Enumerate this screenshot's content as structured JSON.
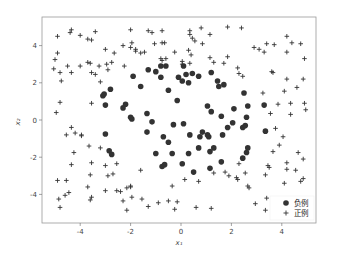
{
  "chart_data": {
    "type": "scatter",
    "title": "",
    "xlabel": "x₁",
    "ylabel": "x₂",
    "xlim": [
      -5.4,
      5.4
    ],
    "ylim": [
      -5.5,
      5.5
    ],
    "xticks": [
      -4,
      -2,
      0,
      2,
      4
    ],
    "yticks": [
      -4,
      -2,
      0,
      2,
      4
    ],
    "grid": false,
    "legend_position": "lower right",
    "series": [
      {
        "name": "负例",
        "marker": "circle",
        "color": "#333333",
        "points": [
          [
            -1.3,
            2.7
          ],
          [
            -1.0,
            2.6
          ],
          [
            -0.8,
            2.9
          ],
          [
            -0.6,
            2.9
          ],
          [
            -0.8,
            2.3
          ],
          [
            -1.9,
            2.35
          ],
          [
            -2.8,
            1.65
          ],
          [
            -1.6,
            1.8
          ],
          [
            -0.5,
            1.6
          ],
          [
            -3.1,
            1.3
          ],
          [
            -3.05,
            1.4
          ],
          [
            -3.0,
            0.8
          ],
          [
            -2.2,
            0.85
          ],
          [
            -2.3,
            0.65
          ],
          [
            -0.15,
            1.05
          ],
          [
            -0.1,
            2.3
          ],
          [
            0.05,
            2.1
          ],
          [
            0.1,
            2.9
          ],
          [
            0.2,
            2.45
          ],
          [
            0.3,
            2.0
          ],
          [
            0.45,
            2.5
          ],
          [
            0.7,
            2.35
          ],
          [
            1.2,
            2.55
          ],
          [
            1.45,
            2.1
          ],
          [
            1.5,
            1.8
          ],
          [
            1.7,
            1.9
          ],
          [
            2.5,
            1.45
          ],
          [
            -2.0,
            0.15
          ],
          [
            -1.95,
            0.05
          ],
          [
            -1.35,
            0.35
          ],
          [
            -1.15,
            -0.1
          ],
          [
            -0.3,
            -0.25
          ],
          [
            0.1,
            -0.2
          ],
          [
            1.05,
            0.75
          ],
          [
            1.2,
            0.45
          ],
          [
            1.6,
            0.2
          ],
          [
            2.1,
            0.6
          ],
          [
            2.65,
            0.75
          ],
          [
            2.6,
            0.15
          ],
          [
            3.3,
            0.8
          ],
          [
            -3.0,
            -0.75
          ],
          [
            -1.35,
            -0.65
          ],
          [
            -0.7,
            -0.9
          ],
          [
            -0.5,
            -1.2
          ],
          [
            0.35,
            -0.8
          ],
          [
            0.75,
            -0.9
          ],
          [
            0.85,
            -0.65
          ],
          [
            1.05,
            -0.8
          ],
          [
            1.1,
            -0.9
          ],
          [
            1.65,
            -0.8
          ],
          [
            1.85,
            -0.4
          ],
          [
            2.05,
            -0.15
          ],
          [
            2.45,
            -0.4
          ],
          [
            2.55,
            -0.3
          ],
          [
            3.35,
            -0.6
          ],
          [
            -2.85,
            -1.65
          ],
          [
            -2.75,
            -1.85
          ],
          [
            -1.0,
            -1.8
          ],
          [
            -0.35,
            -1.8
          ],
          [
            0.3,
            -1.8
          ],
          [
            0.7,
            -1.5
          ],
          [
            1.15,
            -1.7
          ],
          [
            1.3,
            -1.5
          ],
          [
            2.45,
            -2.05
          ],
          [
            2.6,
            -1.75
          ],
          [
            2.65,
            -1.5
          ],
          [
            1.6,
            -2.25
          ],
          [
            -0.75,
            -2.5
          ],
          [
            -0.65,
            -2.4
          ],
          [
            0.05,
            -2.35
          ],
          [
            0.5,
            -2.8
          ],
          [
            1.15,
            -2.6
          ]
        ]
      },
      {
        "name": "正例",
        "marker": "plus",
        "color": "#333333",
        "points": [
          [
            -4.9,
            4.5
          ],
          [
            -4.4,
            4.7
          ],
          [
            -4.35,
            4.85
          ],
          [
            -4.0,
            4.55
          ],
          [
            -3.7,
            4.35
          ],
          [
            -3.55,
            4.3
          ],
          [
            -3.4,
            4.75
          ],
          [
            -2.0,
            4.85
          ],
          [
            -1.3,
            4.8
          ],
          [
            -1.15,
            4.7
          ],
          [
            -0.75,
            4.8
          ],
          [
            0.35,
            4.8
          ],
          [
            0.35,
            4.6
          ],
          [
            0.45,
            4.4
          ],
          [
            0.55,
            4.25
          ],
          [
            0.8,
            4.95
          ],
          [
            1.15,
            4.6
          ],
          [
            1.85,
            5.0
          ],
          [
            2.4,
            4.95
          ],
          [
            4.2,
            4.5
          ],
          [
            -4.9,
            3.6
          ],
          [
            -5.0,
            3.25
          ],
          [
            -4.5,
            2.9
          ],
          [
            -3.7,
            3.1
          ],
          [
            -3.6,
            3.05
          ],
          [
            -3.0,
            3.8
          ],
          [
            -2.65,
            3.6
          ],
          [
            -2.3,
            4.0
          ],
          [
            -2.0,
            3.9
          ],
          [
            -1.95,
            4.15
          ],
          [
            -1.8,
            3.8
          ],
          [
            -1.8,
            3.7
          ],
          [
            -1.6,
            3.6
          ],
          [
            -1.45,
            3.65
          ],
          [
            -1.05,
            4.1
          ],
          [
            -0.75,
            4.15
          ],
          [
            -0.65,
            4.15
          ],
          [
            -0.25,
            3.65
          ],
          [
            0.3,
            3.75
          ],
          [
            0.4,
            3.5
          ],
          [
            0.85,
            4.1
          ],
          [
            1.15,
            3.35
          ],
          [
            1.3,
            3.1
          ],
          [
            1.85,
            3.4
          ],
          [
            2.9,
            3.9
          ],
          [
            3.1,
            3.8
          ],
          [
            3.3,
            3.65
          ],
          [
            3.4,
            4.1
          ],
          [
            3.7,
            4.05
          ],
          [
            4.2,
            3.65
          ],
          [
            4.4,
            4.15
          ],
          [
            4.75,
            4.1
          ],
          [
            4.9,
            3.3
          ],
          [
            -5.05,
            2.75
          ],
          [
            -4.8,
            2.55
          ],
          [
            -4.75,
            2.1
          ],
          [
            -4.35,
            2.55
          ],
          [
            -4.0,
            2.9
          ],
          [
            -3.55,
            2.55
          ],
          [
            -3.4,
            2.45
          ],
          [
            -3.25,
            2.9
          ],
          [
            -3.2,
            2.05
          ],
          [
            -2.95,
            3.0
          ],
          [
            -2.9,
            2.7
          ],
          [
            -2.75,
            3.1
          ],
          [
            -2.25,
            2.9
          ],
          [
            -0.75,
            3.2
          ],
          [
            -0.8,
            3.3
          ],
          [
            -0.6,
            3.3
          ],
          [
            0.05,
            3.15
          ],
          [
            0.05,
            3.0
          ],
          [
            0.35,
            3.05
          ],
          [
            1.7,
            3.05
          ],
          [
            2.25,
            2.8
          ],
          [
            2.3,
            2.5
          ],
          [
            2.45,
            2.35
          ],
          [
            3.6,
            2.6
          ],
          [
            3.65,
            2.55
          ],
          [
            4.2,
            2.2
          ],
          [
            4.85,
            2.2
          ],
          [
            -4.8,
            0.95
          ],
          [
            -4.95,
            0.4
          ],
          [
            -3.55,
            0.9
          ],
          [
            3.25,
            1.45
          ],
          [
            3.85,
            0.85
          ],
          [
            4.1,
            1.55
          ],
          [
            4.35,
            0.9
          ],
          [
            4.35,
            0.3
          ],
          [
            4.6,
            1.75
          ],
          [
            4.9,
            0.9
          ],
          [
            4.95,
            0.55
          ],
          [
            3.55,
            0.35
          ],
          [
            -4.35,
            -0.4
          ],
          [
            -4.55,
            -0.8
          ],
          [
            -4.2,
            -0.7
          ],
          [
            -3.95,
            -0.8
          ],
          [
            -4.25,
            -1.75
          ],
          [
            -3.65,
            -1.4
          ],
          [
            -3.2,
            -1.5
          ],
          [
            -3.95,
            -0.85
          ],
          [
            3.75,
            -0.45
          ],
          [
            4.05,
            -0.9
          ],
          [
            3.65,
            -1.7
          ],
          [
            3.9,
            -1.35
          ],
          [
            4.65,
            -1.75
          ],
          [
            -4.35,
            -2.4
          ],
          [
            -3.55,
            -2.3
          ],
          [
            -3.6,
            -2.95
          ],
          [
            -3.0,
            -2.45
          ],
          [
            -2.9,
            -3.0
          ],
          [
            -2.7,
            -2.9
          ],
          [
            -2.55,
            -2.35
          ],
          [
            -1.6,
            -2.7
          ],
          [
            -0.35,
            -3.55
          ],
          [
            0.15,
            -3.2
          ],
          [
            0.7,
            -3.3
          ],
          [
            1.3,
            -2.85
          ],
          [
            1.75,
            -2.8
          ],
          [
            1.9,
            -3.0
          ],
          [
            2.2,
            -3.1
          ],
          [
            2.25,
            -3.2
          ],
          [
            2.3,
            -2.35
          ],
          [
            2.55,
            -2.85
          ],
          [
            2.65,
            -3.55
          ],
          [
            2.7,
            -3.65
          ],
          [
            3.35,
            -2.95
          ],
          [
            3.45,
            -2.45
          ],
          [
            3.5,
            -2.55
          ],
          [
            4.2,
            -2.3
          ],
          [
            4.2,
            -2.65
          ],
          [
            4.55,
            -2.7
          ],
          [
            4.85,
            -2.1
          ],
          [
            4.85,
            -3.15
          ],
          [
            4.75,
            -3.3
          ],
          [
            -4.9,
            -3.25
          ],
          [
            -4.55,
            -3.25
          ],
          [
            -4.85,
            -4.25
          ],
          [
            -4.6,
            -4.05
          ],
          [
            -4.45,
            -3.9
          ],
          [
            -4.8,
            -4.7
          ],
          [
            -3.7,
            -3.6
          ],
          [
            -3.6,
            -4.3
          ],
          [
            -3.55,
            -4.15
          ],
          [
            -3.0,
            -3.8
          ],
          [
            -2.55,
            -3.8
          ],
          [
            -2.4,
            -3.85
          ],
          [
            -2.3,
            -4.35
          ],
          [
            -2.15,
            -3.65
          ],
          [
            -2.0,
            -3.55
          ],
          [
            -2.0,
            -3.6
          ],
          [
            -1.95,
            -4.15
          ],
          [
            -2.15,
            -4.85
          ],
          [
            -1.55,
            -4.25
          ],
          [
            -1.3,
            -4.65
          ],
          [
            -0.9,
            -4.45
          ],
          [
            -0.5,
            -4.35
          ],
          [
            -0.15,
            -4.4
          ],
          [
            -0.25,
            -4.8
          ],
          [
            0.6,
            -4.7
          ],
          [
            1.2,
            -4.75
          ],
          [
            2.95,
            -4.5
          ],
          [
            3.35,
            -4.85
          ],
          [
            3.4,
            -4.2
          ],
          [
            4.1,
            -3.4
          ]
        ]
      }
    ]
  },
  "legend": {
    "items": [
      {
        "label": "负例",
        "marker": "circle"
      },
      {
        "label": "正例",
        "marker": "plus"
      }
    ]
  },
  "axes": {
    "xlabel": "x₁",
    "ylabel": "x₂",
    "xtick_labels": [
      "-4",
      "-2",
      "0",
      "2",
      "4"
    ],
    "ytick_labels": [
      "4",
      "2",
      "0",
      "-2",
      "-4"
    ]
  }
}
